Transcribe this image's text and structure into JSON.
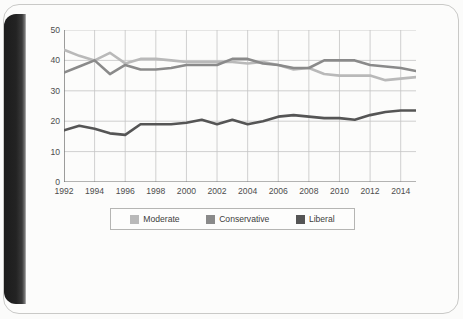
{
  "chart_data": {
    "type": "line",
    "title": "",
    "xlabel": "",
    "ylabel": "PERCENTAGE",
    "x": [
      1992,
      1993,
      1994,
      1995,
      1996,
      1997,
      1998,
      1999,
      2000,
      2001,
      2002,
      2003,
      2004,
      2005,
      2006,
      2007,
      2008,
      2009,
      2010,
      2011,
      2012,
      2013,
      2014,
      2015
    ],
    "xlim": [
      1992,
      2015
    ],
    "ylim": [
      0,
      50
    ],
    "yticks": [
      0,
      10,
      20,
      30,
      40,
      50
    ],
    "xticks": [
      1992,
      1994,
      1996,
      1998,
      2000,
      2002,
      2004,
      2006,
      2008,
      2010,
      2012,
      2014
    ],
    "grid": true,
    "legend_position": "bottom",
    "series": [
      {
        "name": "Moderate",
        "color": "#b9b9b9",
        "values": [
          43.5,
          41.5,
          40.0,
          42.5,
          39.0,
          40.5,
          40.5,
          40.0,
          39.5,
          39.5,
          39.5,
          39.5,
          39.0,
          39.5,
          38.5,
          37.0,
          37.5,
          35.5,
          35.0,
          35.0,
          35.0,
          33.5,
          34.0,
          34.5
        ]
      },
      {
        "name": "Conservative",
        "color": "#8a8a8a",
        "values": [
          36.0,
          38.0,
          40.0,
          35.5,
          38.5,
          37.0,
          37.0,
          37.5,
          38.5,
          38.5,
          38.5,
          40.5,
          40.5,
          39.0,
          38.5,
          37.5,
          37.5,
          40.0,
          40.0,
          40.0,
          38.5,
          38.0,
          37.5,
          36.5
        ]
      },
      {
        "name": "Liberal",
        "color": "#555555",
        "values": [
          17.0,
          18.5,
          17.5,
          16.0,
          15.5,
          19.0,
          19.0,
          19.0,
          19.5,
          20.5,
          19.0,
          20.5,
          19.0,
          20.0,
          21.5,
          22.0,
          21.5,
          21.0,
          21.0,
          20.5,
          22.0,
          23.0,
          23.5,
          23.5
        ]
      }
    ]
  },
  "legend": {
    "items": [
      {
        "label": "Moderate"
      },
      {
        "label": "Conservative"
      },
      {
        "label": "Liberal"
      }
    ]
  },
  "axis": {
    "y_title": "PERCENTAGE"
  },
  "colors": {
    "moderate": "#b9b9b9",
    "conservative": "#8a8a8a",
    "liberal": "#555555",
    "grid": "#c4c4c4",
    "axis": "#6b6b6b",
    "page": "#fcfcfb",
    "spine": "#1f1f1f"
  }
}
